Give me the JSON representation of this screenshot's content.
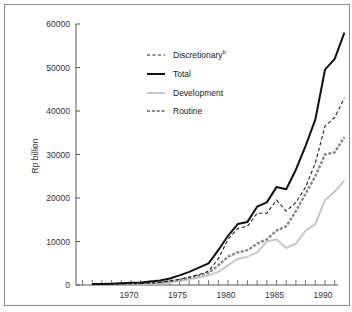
{
  "chart_data": {
    "type": "line",
    "title": "",
    "xlabel": "",
    "ylabel": "Rp billion",
    "ylim": [
      0,
      60000
    ],
    "xlim": [
      1965,
      1992
    ],
    "grid": false,
    "legend_position": "upper-left inside",
    "y_ticks": [
      0,
      10000,
      20000,
      30000,
      40000,
      50000,
      60000
    ],
    "x_ticks": [
      1970,
      1975,
      1980,
      1985,
      1990
    ],
    "x": [
      1966,
      1967,
      1968,
      1969,
      1970,
      1971,
      1972,
      1973,
      1974,
      1975,
      1976,
      1977,
      1978,
      1979,
      1980,
      1981,
      1982,
      1983,
      1984,
      1985,
      1986,
      1987,
      1988,
      1989,
      1990,
      1991,
      1992
    ],
    "series": [
      {
        "name": "Discretionary",
        "superscript": "b",
        "style": "dashed-black",
        "values": [
          100,
          150,
          200,
          250,
          300,
          350,
          450,
          600,
          900,
          1300,
          1800,
          2400,
          3200,
          6000,
          10500,
          13000,
          13500,
          16500,
          16500,
          19500,
          17000,
          19000,
          22500,
          28000,
          36500,
          38500,
          43000
        ]
      },
      {
        "name": "Total",
        "style": "solid-black",
        "values": [
          200,
          250,
          300,
          400,
          500,
          600,
          800,
          1000,
          1500,
          2200,
          3000,
          4000,
          5000,
          8000,
          11300,
          14000,
          14500,
          18000,
          19000,
          22500,
          22000,
          26500,
          32000,
          38000,
          49500,
          52000,
          58000
        ]
      },
      {
        "name": "Development",
        "style": "solid-lightgray",
        "values": [
          50,
          80,
          100,
          120,
          150,
          200,
          300,
          400,
          600,
          900,
          1300,
          1700,
          2200,
          3000,
          4500,
          6000,
          6500,
          7500,
          10000,
          10500,
          8500,
          9500,
          12500,
          14000,
          19500,
          21500,
          24000
        ]
      },
      {
        "name": "Routine",
        "style": "dashed-gray-thick",
        "values": [
          150,
          170,
          200,
          250,
          350,
          400,
          500,
          600,
          900,
          1200,
          1700,
          2200,
          2800,
          4500,
          6500,
          7500,
          8000,
          9500,
          10500,
          12500,
          13500,
          17000,
          21000,
          25000,
          30000,
          30500,
          34000
        ]
      }
    ]
  },
  "axes": {
    "ylabel": "Rp billion",
    "y_tick_labels": [
      "0",
      "10000",
      "20000",
      "30000",
      "40000",
      "50000",
      "60000"
    ],
    "x_tick_labels": [
      "1970",
      "1975",
      "1980",
      "1985",
      "1990"
    ]
  },
  "legend": [
    {
      "label": "Discretionary",
      "sup": "b"
    },
    {
      "label": "Total"
    },
    {
      "label": "Development"
    },
    {
      "label": "Routine"
    }
  ],
  "colors": {
    "discretionary": "#222222",
    "total": "#111111",
    "development": "#c8c8c8",
    "routine": "#888888",
    "frame": "#8a8a8a",
    "axis": "#555555"
  }
}
